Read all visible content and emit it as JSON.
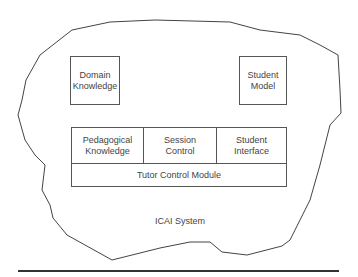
{
  "diagram": {
    "system_label": "ICAI System",
    "components": {
      "domain_knowledge": "Domain\nKnowledge",
      "student_model": "Student\nModel",
      "pedagogical_knowledge": "Pedagogical\nKnowledge",
      "session_control": "Session\nControl",
      "student_interface": "Student\nInterface",
      "tutor_control_module": "Tutor Control Module"
    }
  }
}
